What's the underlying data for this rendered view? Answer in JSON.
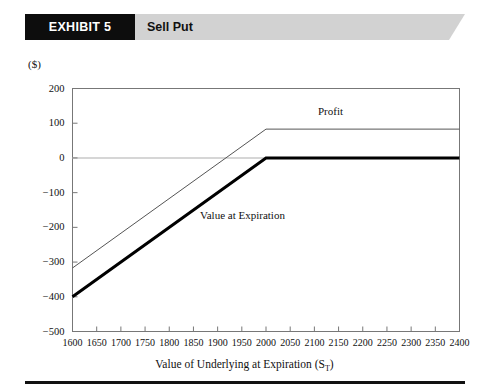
{
  "header": {
    "tag_label": "EXHIBIT 5",
    "title": "Sell Put",
    "tag_bg": "#0d0d0d",
    "banner_bg": "#d2d2d2"
  },
  "chart_data": {
    "type": "line",
    "title": "Sell Put",
    "xlabel": "Value of Underlying at Expiration (S",
    "xlabel_sub": "T",
    "xlabel_suffix": ")",
    "ylabel": "($)",
    "xlim": [
      1600,
      2400
    ],
    "ylim": [
      -500,
      200
    ],
    "grid": false,
    "legend_position": "inline-annotation",
    "x_ticks": [
      1600,
      1650,
      1700,
      1750,
      1800,
      1850,
      1900,
      1950,
      2000,
      2050,
      2100,
      2150,
      2200,
      2250,
      2300,
      2350,
      2400
    ],
    "y_ticks": [
      200,
      100,
      0,
      -100,
      -200,
      -300,
      -400,
      -500
    ],
    "zero_line": 0,
    "series": [
      {
        "name": "Profit",
        "style": "thin",
        "color": "#555555",
        "x": [
          1600,
          2000,
          2400
        ],
        "values": [
          -317,
          83,
          83
        ]
      },
      {
        "name": "Value at Expiration",
        "style": "thick",
        "color": "#000000",
        "x": [
          1600,
          2000,
          2400
        ],
        "values": [
          -400,
          0,
          0
        ]
      }
    ],
    "annotations": [
      {
        "text": "Profit",
        "x": 2175,
        "y": 150
      },
      {
        "text": "Value  at Expiration",
        "x": 1900,
        "y": -160
      }
    ]
  }
}
